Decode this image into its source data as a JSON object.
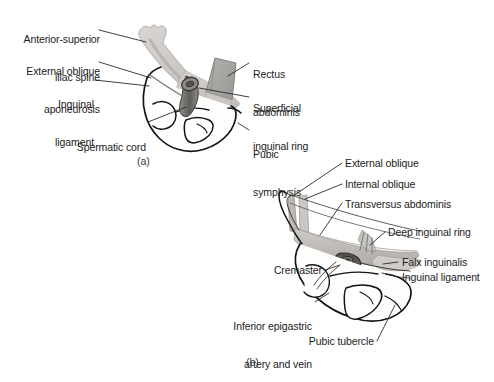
{
  "figure": {
    "background_color": "#ffffff",
    "ink_color": "#1b1b1b",
    "palette": {
      "aponeurosis_fill": "#c9c6c1",
      "aponeurosis_fill_light": "#d8d5d0",
      "rectus_fill": "#a6a4a0",
      "bone_fill": "#fbfbfa",
      "muscle_mid": "#b9b6b1",
      "cord_dark": "#6f6d6a",
      "leader_line": "#2a2a2a"
    }
  },
  "panel_a": {
    "id": "(a)",
    "labels": [
      {
        "key": "anterior_superior_iliac_spine",
        "lines": [
          "Anterior-superior",
          "iliac spine"
        ],
        "align": "right"
      },
      {
        "key": "external_oblique_aponeurosis",
        "lines": [
          "External oblique",
          "aponeurosis"
        ],
        "align": "right"
      },
      {
        "key": "inguinal_ligament",
        "lines": [
          "Inguinal",
          "ligament"
        ],
        "align": "right"
      },
      {
        "key": "spermatic_cord",
        "lines": [
          "Spermatic cord"
        ],
        "align": "right"
      },
      {
        "key": "rectus_abdominis",
        "lines": [
          "Rectus",
          "abdominis"
        ],
        "align": "left"
      },
      {
        "key": "superficial_inguinal_ring",
        "lines": [
          "Superficial",
          "inguinal ring"
        ],
        "align": "left"
      },
      {
        "key": "pubic_symphysis",
        "lines": [
          "Pubic",
          "symphysis"
        ],
        "align": "left"
      }
    ]
  },
  "panel_b": {
    "id": "(b)",
    "labels": [
      {
        "key": "external_oblique",
        "lines": [
          "External oblique"
        ],
        "align": "left"
      },
      {
        "key": "internal_oblique",
        "lines": [
          "Internal oblique"
        ],
        "align": "left"
      },
      {
        "key": "transversus_abdominis",
        "lines": [
          "Transversus abdominis"
        ],
        "align": "left"
      },
      {
        "key": "deep_inguinal_ring",
        "lines": [
          "Deep inguinal ring"
        ],
        "align": "left"
      },
      {
        "key": "falx_inguinalis",
        "lines": [
          "Falx inguinalis"
        ],
        "align": "left"
      },
      {
        "key": "inguinal_ligament",
        "lines": [
          "Inguinal ligament"
        ],
        "align": "left"
      },
      {
        "key": "cremaster",
        "lines": [
          "Cremaster"
        ],
        "align": "right"
      },
      {
        "key": "inferior_epigastric_artery_and_vein",
        "lines": [
          "Inferior epigastric",
          "artery and vein"
        ],
        "align": "right"
      },
      {
        "key": "pubic_tubercle",
        "lines": [
          "Pubic tubercle"
        ],
        "align": "right"
      }
    ]
  },
  "labels_text": {
    "a_asis_l1": "Anterior-superior",
    "a_asis_l2": "iliac spine",
    "a_eoa_l1": "External oblique",
    "a_eoa_l2": "aponeurosis",
    "a_ing_l1": "Inguinal",
    "a_ing_l2": "ligament",
    "a_cord": "Spermatic cord",
    "a_rect_l1": "Rectus",
    "a_rect_l2": "abdominis",
    "a_sir_l1": "Superficial",
    "a_sir_l2": "inguinal ring",
    "a_pub_l1": "Pubic",
    "a_pub_l2": "symphysis",
    "a_panel": "(a)",
    "b_eo": "External oblique",
    "b_io": "Internal oblique",
    "b_ta": "Transversus abdominis",
    "b_dir": "Deep inguinal ring",
    "b_falx": "Falx inguinalis",
    "b_il": "Inguinal ligament",
    "b_crem": "Cremaster",
    "b_iea_l1": "Inferior epigastric",
    "b_iea_l2": "artery and vein",
    "b_pt": "Pubic tubercle",
    "b_panel": "(b)"
  }
}
